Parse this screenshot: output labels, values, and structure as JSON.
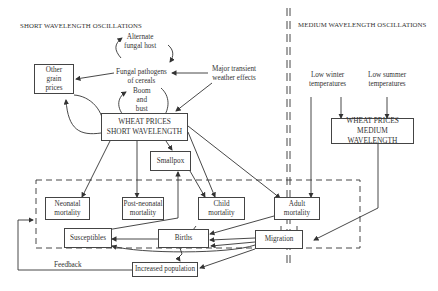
{
  "sections": {
    "short": "SHORT WAVELENGTH OSCILLATIONS",
    "medium": "MEDIUM WAVELENGTH OSCILLATIONS"
  },
  "nodes": {
    "alternate_host": [
      "Alternate",
      "fungal host"
    ],
    "fungal_pathogens": [
      "Fungal pathogens",
      "of cereals"
    ],
    "boom_bust": [
      "Boom",
      "and",
      "bust"
    ],
    "major_weather": [
      "Major transient",
      "weather effects"
    ],
    "other_grain": [
      "Other",
      "grain",
      "prices"
    ],
    "wheat_short": [
      "WHEAT PRICES",
      "SHORT WAVELENGTH"
    ],
    "smallpox": "Smallpox",
    "neonatal": [
      "Neonatal",
      "mortality"
    ],
    "post_neonatal": [
      "Post-neonatal",
      "mortality"
    ],
    "child": [
      "Child",
      "mortality"
    ],
    "adult": [
      "Adult",
      "mortality"
    ],
    "susceptibles": "Susceptibles",
    "births": "Births",
    "migration": "Migration",
    "increased_population": "Increased population",
    "feedback": "Feedback",
    "low_winter": [
      "Low winter",
      "temperatures"
    ],
    "low_summer": [
      "Low summer",
      "temperatures"
    ],
    "wheat_medium": [
      "WHEAT PRICES",
      "MEDIUM WAVELENGTH"
    ]
  },
  "colors": {
    "line": "#333333",
    "background": "#ffffff"
  }
}
